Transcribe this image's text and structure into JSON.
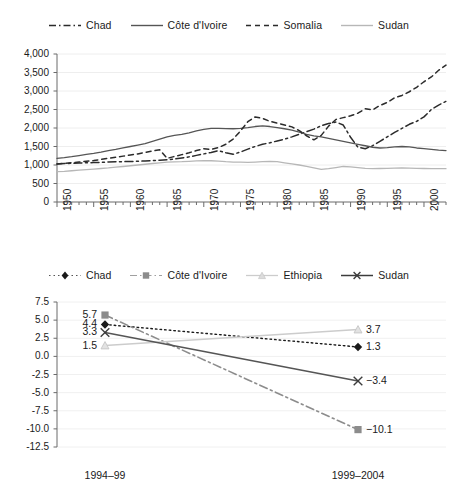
{
  "chart_data": [
    {
      "id": "top",
      "type": "line",
      "title": "",
      "xlabel": "",
      "ylabel": "",
      "xlim": [
        1950,
        2003
      ],
      "ylim": [
        0,
        4000
      ],
      "ytick_labels": [
        "0",
        "500",
        "1,000",
        "1,500",
        "2,000",
        "2,500",
        "3,000",
        "3,500",
        "4,000"
      ],
      "ytick_values": [
        0,
        500,
        1000,
        1500,
        2000,
        2500,
        3000,
        3500,
        4000
      ],
      "xtick_labels": [
        "1950",
        "1955",
        "1960",
        "1965",
        "1970",
        "1975",
        "1980",
        "1985",
        "1990",
        "1995",
        "2000"
      ],
      "xtick_values": [
        1950,
        1955,
        1960,
        1965,
        1970,
        1975,
        1980,
        1985,
        1990,
        1995,
        2000
      ],
      "minor_tick_step": 1,
      "grid": "horizontal",
      "legend_position": "top",
      "legend": [
        "Chad",
        "Côte d'Ivoire",
        "Somalia",
        "Sudan"
      ],
      "series": [
        {
          "name": "Chad",
          "style": "dash-dot",
          "color": "#2b2b2b",
          "x": [
            1950,
            1951,
            1952,
            1953,
            1954,
            1955,
            1956,
            1957,
            1958,
            1959,
            1960,
            1961,
            1962,
            1963,
            1964,
            1965,
            1966,
            1967,
            1968,
            1969,
            1970,
            1971,
            1972,
            1973,
            1974,
            1975,
            1976,
            1977,
            1978,
            1979,
            1980,
            1981,
            1982,
            1983,
            1984,
            1985,
            1986,
            1987,
            1988,
            1989,
            1990,
            1991,
            1992,
            1993,
            1994,
            1995,
            1996,
            1997,
            1998,
            1999,
            2000,
            2001,
            2002,
            2003
          ],
          "values": [
            1030,
            1040,
            1045,
            1055,
            1060,
            1065,
            1070,
            1080,
            1085,
            1090,
            1095,
            1100,
            1110,
            1120,
            1130,
            1140,
            1160,
            1190,
            1220,
            1260,
            1300,
            1340,
            1390,
            1330,
            1290,
            1350,
            1430,
            1500,
            1560,
            1600,
            1650,
            1700,
            1760,
            1830,
            1900,
            1970,
            2060,
            2120,
            2160,
            2080,
            1750,
            1480,
            1440,
            1520,
            1640,
            1760,
            1880,
            1990,
            2100,
            2180,
            2300,
            2500,
            2620,
            2720
          ]
        },
        {
          "name": "Côte d'Ivoire",
          "style": "solid",
          "color": "#555555",
          "x": [
            1950,
            1951,
            1952,
            1953,
            1954,
            1955,
            1956,
            1957,
            1958,
            1959,
            1960,
            1961,
            1962,
            1963,
            1964,
            1965,
            1966,
            1967,
            1968,
            1969,
            1970,
            1971,
            1972,
            1973,
            1974,
            1975,
            1976,
            1977,
            1978,
            1979,
            1980,
            1981,
            1982,
            1983,
            1984,
            1985,
            1986,
            1987,
            1988,
            1989,
            1990,
            1991,
            1992,
            1993,
            1994,
            1995,
            1996,
            1997,
            1998,
            1999,
            2000,
            2001,
            2002,
            2003
          ],
          "values": [
            1180,
            1200,
            1225,
            1255,
            1285,
            1315,
            1350,
            1390,
            1420,
            1460,
            1500,
            1540,
            1580,
            1640,
            1700,
            1760,
            1800,
            1830,
            1870,
            1920,
            1960,
            1990,
            1990,
            1985,
            1980,
            1990,
            2010,
            2040,
            2060,
            2040,
            2010,
            1980,
            1940,
            1890,
            1830,
            1790,
            1760,
            1720,
            1680,
            1640,
            1600,
            1560,
            1520,
            1480,
            1460,
            1470,
            1490,
            1500,
            1490,
            1460,
            1440,
            1420,
            1400,
            1390
          ]
        },
        {
          "name": "Somalia",
          "style": "dashed",
          "color": "#2b2b2b",
          "x": [
            1950,
            1951,
            1952,
            1953,
            1954,
            1955,
            1956,
            1957,
            1958,
            1959,
            1960,
            1961,
            1962,
            1963,
            1964,
            1965,
            1966,
            1967,
            1968,
            1969,
            1970,
            1971,
            1972,
            1973,
            1974,
            1975,
            1976,
            1977,
            1978,
            1979,
            1980,
            1981,
            1982,
            1983,
            1984,
            1985,
            1986,
            1987,
            1988,
            1989,
            1990,
            1991,
            1992,
            1993,
            1994,
            1995,
            1996,
            1997,
            1998,
            1999,
            2000,
            2001,
            2002,
            2003
          ],
          "values": [
            1030,
            1045,
            1060,
            1080,
            1100,
            1120,
            1150,
            1180,
            1210,
            1240,
            1270,
            1300,
            1340,
            1380,
            1410,
            1180,
            1230,
            1280,
            1330,
            1390,
            1440,
            1420,
            1470,
            1560,
            1700,
            1920,
            2170,
            2300,
            2260,
            2180,
            2130,
            2080,
            2030,
            1930,
            1790,
            1680,
            1800,
            2050,
            2230,
            2280,
            2330,
            2400,
            2520,
            2490,
            2610,
            2690,
            2820,
            2880,
            2980,
            3100,
            3250,
            3380,
            3560,
            3700
          ]
        },
        {
          "name": "Sudan",
          "style": "solid",
          "color": "#b7b7b7",
          "x": [
            1950,
            1951,
            1952,
            1953,
            1954,
            1955,
            1956,
            1957,
            1958,
            1959,
            1960,
            1961,
            1962,
            1963,
            1964,
            1965,
            1966,
            1967,
            1968,
            1969,
            1970,
            1971,
            1972,
            1973,
            1974,
            1975,
            1976,
            1977,
            1978,
            1979,
            1980,
            1981,
            1982,
            1983,
            1984,
            1985,
            1986,
            1987,
            1988,
            1989,
            1990,
            1991,
            1992,
            1993,
            1994,
            1995,
            1996,
            1997,
            1998,
            1999,
            2000,
            2001,
            2002,
            2003
          ],
          "values": [
            820,
            830,
            845,
            860,
            875,
            890,
            905,
            920,
            940,
            960,
            980,
            1000,
            1020,
            1040,
            1060,
            1075,
            1085,
            1090,
            1100,
            1110,
            1120,
            1115,
            1105,
            1090,
            1080,
            1075,
            1070,
            1080,
            1090,
            1100,
            1090,
            1060,
            1030,
            1000,
            960,
            920,
            880,
            900,
            930,
            960,
            950,
            930,
            910,
            900,
            905,
            910,
            915,
            920,
            915,
            910,
            905,
            900,
            900,
            900
          ]
        }
      ]
    },
    {
      "id": "bottom",
      "type": "line",
      "title": "",
      "xlabel": "",
      "ylabel": "",
      "ylim": [
        -12.5,
        7.5
      ],
      "ytick_labels": [
        "7.5",
        "5.0",
        "2.5",
        "0.0",
        "-2.5",
        "-5.0",
        "-7.5",
        "-10.0",
        "-12.5"
      ],
      "ytick_values": [
        7.5,
        5.0,
        2.5,
        0.0,
        -2.5,
        -5.0,
        -7.5,
        -10.0,
        -12.5
      ],
      "categories": [
        "1994–99",
        "1999–2004"
      ],
      "grid": "horizontal",
      "legend_position": "top",
      "legend": [
        "Chad",
        "Côte d'Ivoire",
        "Ethiopia",
        "Sudan"
      ],
      "series": [
        {
          "name": "Chad",
          "marker": "diamond",
          "style": "dotted",
          "color": "#1a1a1a",
          "values": [
            4.4,
            1.3
          ],
          "labels": [
            "4.4",
            "1.3"
          ]
        },
        {
          "name": "Côte d'Ivoire",
          "marker": "square",
          "style": "dash-dot",
          "color": "#8c8c8c",
          "values": [
            5.7,
            -10.1
          ],
          "labels": [
            "5.7",
            "-10.1"
          ]
        },
        {
          "name": "Ethiopia",
          "marker": "triangle",
          "style": "solid",
          "color": "#cccccc",
          "values": [
            1.5,
            3.7
          ],
          "labels": [
            "1.5",
            "3.7"
          ]
        },
        {
          "name": "Sudan",
          "marker": "x",
          "style": "solid",
          "color": "#555555",
          "values": [
            3.3,
            -3.4
          ],
          "labels": [
            "3.3",
            "-3.4"
          ]
        }
      ]
    }
  ],
  "top_chart": {
    "legend": [
      {
        "label": "Chad",
        "key": "dash-dot-dark"
      },
      {
        "label": "Côte d'Ivoire",
        "key": "solid-gray"
      },
      {
        "label": "Somalia",
        "key": "dashed-dark"
      },
      {
        "label": "Sudan",
        "key": "solid-light"
      }
    ]
  },
  "bottom_chart": {
    "legend": [
      {
        "label": "Chad",
        "key": "dotted-diamond"
      },
      {
        "label": "Côte d'Ivoire",
        "key": "dashdot-square"
      },
      {
        "label": "Ethiopia",
        "key": "solid-light-triangle"
      },
      {
        "label": "Sudan",
        "key": "solid-x"
      }
    ]
  }
}
